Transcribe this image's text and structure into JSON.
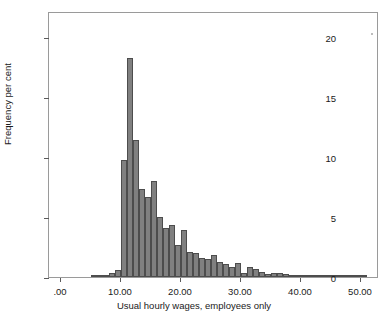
{
  "chart_data": {
    "type": "bar",
    "title": "",
    "subtitle": "",
    "xlabel": "Usual hourly wages, employees only",
    "ylabel": "Frequency per cent",
    "xlim": [
      -2.0,
      53.0
    ],
    "ylim": [
      0,
      22.2
    ],
    "grid": false,
    "legend": null,
    "bin_width": 1.0,
    "bar_color": "#808080",
    "bar_edge_color": "#4d4d4d",
    "frame_color": "#9a9a9a",
    "x_ticks": [
      0,
      10,
      20,
      30,
      40,
      50
    ],
    "x_tick_labels": [
      ".00",
      "10.00",
      "20.00",
      "30.00",
      "40.00",
      "50.00"
    ],
    "y_ticks": [
      0,
      5,
      10,
      15,
      20
    ],
    "y_tick_labels": [
      "0",
      "5",
      "10",
      "15",
      "20"
    ],
    "bins": [
      {
        "x0": 5.0,
        "x1": 6.0,
        "value": 0.05
      },
      {
        "x0": 6.0,
        "x1": 7.0,
        "value": 0.08
      },
      {
        "x0": 7.0,
        "x1": 8.0,
        "value": 0.15
      },
      {
        "x0": 8.0,
        "x1": 9.0,
        "value": 0.3
      },
      {
        "x0": 9.0,
        "x1": 10.0,
        "value": 0.62
      },
      {
        "x0": 10.0,
        "x1": 11.0,
        "value": 9.75
      },
      {
        "x0": 11.0,
        "x1": 12.0,
        "value": 18.3
      },
      {
        "x0": 12.0,
        "x1": 13.0,
        "value": 11.4
      },
      {
        "x0": 13.0,
        "x1": 14.0,
        "value": 7.35
      },
      {
        "x0": 14.0,
        "x1": 15.0,
        "value": 6.65
      },
      {
        "x0": 15.0,
        "x1": 16.0,
        "value": 8.0
      },
      {
        "x0": 16.0,
        "x1": 17.0,
        "value": 5.05
      },
      {
        "x0": 17.0,
        "x1": 18.0,
        "value": 4.1
      },
      {
        "x0": 18.0,
        "x1": 19.0,
        "value": 4.35
      },
      {
        "x0": 19.0,
        "x1": 20.0,
        "value": 2.7
      },
      {
        "x0": 20.0,
        "x1": 21.0,
        "value": 3.9
      },
      {
        "x0": 21.0,
        "x1": 22.0,
        "value": 2.1
      },
      {
        "x0": 22.0,
        "x1": 23.0,
        "value": 2.0
      },
      {
        "x0": 23.0,
        "x1": 24.0,
        "value": 1.55
      },
      {
        "x0": 24.0,
        "x1": 25.0,
        "value": 1.5
      },
      {
        "x0": 25.0,
        "x1": 26.0,
        "value": 1.8
      },
      {
        "x0": 26.0,
        "x1": 27.0,
        "value": 1.25
      },
      {
        "x0": 27.0,
        "x1": 28.0,
        "value": 1.1
      },
      {
        "x0": 28.0,
        "x1": 29.0,
        "value": 0.85
      },
      {
        "x0": 29.0,
        "x1": 30.0,
        "value": 1.15
      },
      {
        "x0": 30.0,
        "x1": 31.0,
        "value": 0.3
      },
      {
        "x0": 31.0,
        "x1": 32.0,
        "value": 0.8
      },
      {
        "x0": 32.0,
        "x1": 33.0,
        "value": 0.7
      },
      {
        "x0": 33.0,
        "x1": 34.0,
        "value": 0.45
      },
      {
        "x0": 34.0,
        "x1": 35.0,
        "value": 0.28
      },
      {
        "x0": 35.0,
        "x1": 36.0,
        "value": 0.32
      },
      {
        "x0": 36.0,
        "x1": 37.0,
        "value": 0.35
      },
      {
        "x0": 37.0,
        "x1": 38.0,
        "value": 0.22
      },
      {
        "x0": 38.0,
        "x1": 39.0,
        "value": 0.18
      },
      {
        "x0": 39.0,
        "x1": 40.0,
        "value": 0.1
      },
      {
        "x0": 40.0,
        "x1": 41.0,
        "value": 0.16
      },
      {
        "x0": 41.0,
        "x1": 42.0,
        "value": 0.05
      },
      {
        "x0": 42.0,
        "x1": 43.0,
        "value": 0.04
      },
      {
        "x0": 43.0,
        "x1": 44.0,
        "value": 0.07
      },
      {
        "x0": 44.0,
        "x1": 45.0,
        "value": 0.03
      },
      {
        "x0": 45.0,
        "x1": 46.0,
        "value": 0.03
      },
      {
        "x0": 46.0,
        "x1": 47.0,
        "value": 0.02
      },
      {
        "x0": 47.0,
        "x1": 48.0,
        "value": 0.02
      },
      {
        "x0": 48.0,
        "x1": 49.0,
        "value": 0.03
      },
      {
        "x0": 49.0,
        "x1": 50.0,
        "value": 0.05
      },
      {
        "x0": 50.0,
        "x1": 51.0,
        "value": 0.04
      }
    ]
  }
}
